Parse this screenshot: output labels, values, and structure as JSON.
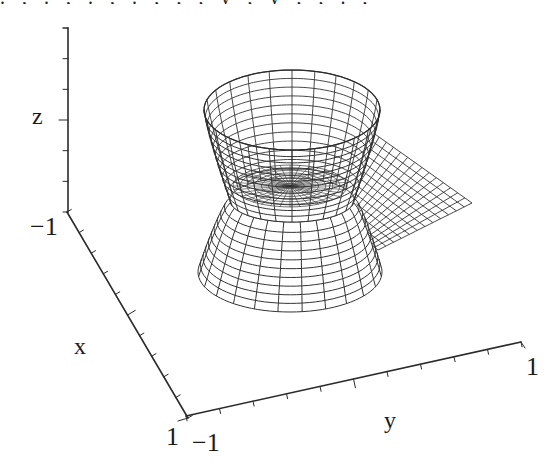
{
  "figure": {
    "background": "#ffffff",
    "line_color": "#2a2a2a",
    "mesh_color": "#333333",
    "cropped_top_text": ". , . , . ,   . ; , , y , y , , . ,"
  },
  "chart_data": {
    "type": "surface3d-wireframe",
    "title": "",
    "axes": {
      "x": {
        "label": "x",
        "range": [
          -1,
          1
        ],
        "tick_labels": [
          "1"
        ],
        "num_ticks": 10
      },
      "y": {
        "label": "y",
        "range": [
          -1,
          1
        ],
        "tick_labels": [
          "-1",
          "1"
        ],
        "num_ticks": 10
      },
      "z": {
        "label": "z",
        "range": [
          -1,
          1
        ],
        "tick_labels": [
          "-1"
        ],
        "num_ticks": 7
      }
    },
    "grid": false,
    "legend": null,
    "surface": {
      "description": "Wireframe surface: upper bowl (polar mesh converging to center), flared lower skirt, and a flat rectangular-grid wing extending toward +y",
      "upper_bowl": {
        "rim_center": [
          292,
          110
        ],
        "rim_rx": 88,
        "rim_ry": 40,
        "waist_center": [
          292,
          200
        ],
        "waist_rx": 62,
        "waist_ry": 22,
        "radial_lines": 24,
        "rings": 12
      },
      "lower_skirt": {
        "top_center": [
          292,
          200
        ],
        "top_rx": 62,
        "top_ry": 22,
        "bottom_center": [
          290,
          272
        ],
        "bottom_rx": 92,
        "bottom_ry": 40,
        "radial_lines": 24,
        "rings": 10
      },
      "wing": {
        "corners": [
          [
            372,
            132
          ],
          [
            472,
            203
          ],
          [
            378,
            250
          ],
          [
            330,
            212
          ]
        ],
        "u_lines": 14,
        "v_lines": 12
      }
    }
  },
  "labels": {
    "z_axis": "z",
    "x_axis": "x",
    "y_axis": "y",
    "z_min": "−1",
    "x_max": "1",
    "y_min": "−1",
    "y_max": "1"
  },
  "geometry": {
    "z_axis": {
      "from": [
        68,
        28
      ],
      "to": [
        68,
        212
      ]
    },
    "x_axis": {
      "from": [
        67,
        212
      ],
      "to": [
        188,
        418
      ]
    },
    "y_axis": {
      "from": [
        186,
        416
      ],
      "to": [
        521,
        342
      ]
    }
  }
}
